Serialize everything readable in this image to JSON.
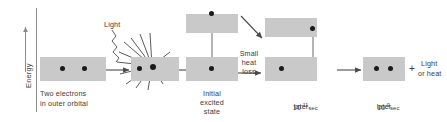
{
  "figure": {
    "type": "energy-level-diagram",
    "title_axis": "Energy",
    "background": "#ffffff",
    "band_color": "#c9c9c9",
    "electron_color": "#1a1a1a",
    "arrow_color": "#4a4a4a"
  },
  "axis": {
    "label": "Energy",
    "direction": "up"
  },
  "panels": [
    {
      "id": "panel-ground",
      "caption_lines": [
        "Two electrons",
        "in outer orbital"
      ],
      "electrons_lower": 2,
      "electrons_upper": 0
    },
    {
      "id": "panel-absorption",
      "caption_lines": [],
      "photon_label": "Light",
      "electrons_lower": 2,
      "electrons_upper": 0
    },
    {
      "id": "panel-excited",
      "caption_lines": [
        "Initial",
        "excited",
        "state"
      ],
      "electrons_lower": 1,
      "electrons_upper": 1
    },
    {
      "id": "panel-relaxed",
      "caption_lines": [
        "10⁻¹¹ sec",
        "later"
      ],
      "time_mantissa": "10",
      "time_exponent": "-11",
      "time_unit": "sec",
      "time_suffix": "later",
      "electrons_lower": 1,
      "electrons_upper": 1
    },
    {
      "id": "panel-emission",
      "caption_lines": [
        "10⁻⁹ sec",
        "later"
      ],
      "time_mantissa": "10",
      "time_exponent": "-9",
      "time_unit": "sec",
      "time_suffix": "later",
      "electrons_lower": 2,
      "electrons_upper": 0
    }
  ],
  "transitions": {
    "arrow_1_2": "→",
    "arrow_2_3": "→",
    "arrow_3_4_label_lines": [
      "Small",
      "heat",
      "loss"
    ],
    "arrow_4_5": "→",
    "diagonal_arrow": "down-right"
  },
  "output": {
    "plus_sign": "+",
    "lines": [
      "Light",
      "or heat"
    ]
  }
}
